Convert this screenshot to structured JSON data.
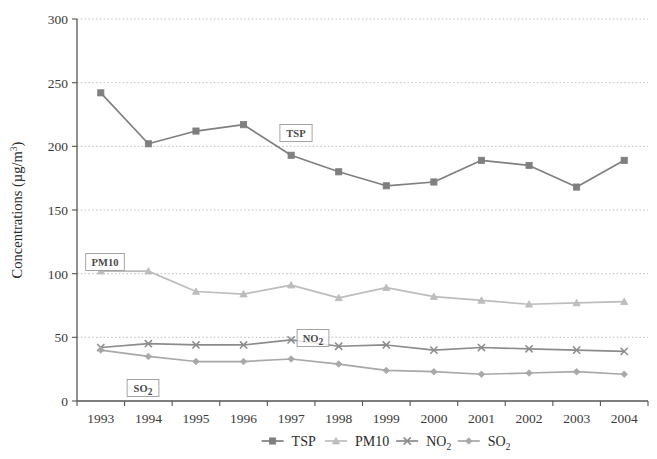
{
  "chart_data": {
    "type": "line",
    "title": "",
    "xlabel": "",
    "ylabel": "Concentrations (µg/m³)",
    "ylabel_base": "Concentrations (µg/m",
    "ylabel_sup": "3",
    "ylabel_tail": ")",
    "categories": [
      "1993",
      "1994",
      "1995",
      "1996",
      "1997",
      "1998",
      "1999",
      "2000",
      "2001",
      "2002",
      "2003",
      "2004"
    ],
    "x": [
      1993,
      1994,
      1995,
      1996,
      1997,
      1998,
      1999,
      2000,
      2001,
      2002,
      2003,
      2004
    ],
    "ylim": [
      0,
      300
    ],
    "yticks": [
      0,
      50,
      100,
      150,
      200,
      250,
      300
    ],
    "ytick_labels": [
      "0",
      "50",
      "100",
      "150",
      "200",
      "250",
      "300"
    ],
    "grid": true,
    "grid_style": "dotted-horizontal",
    "legend_position": "bottom",
    "series": [
      {
        "name": "TSP",
        "marker": "square",
        "color": "#7f7f7f",
        "values": [
          242,
          202,
          212,
          217,
          193,
          180,
          169,
          172,
          189,
          185,
          168,
          189
        ]
      },
      {
        "name": "PM10",
        "marker": "triangle",
        "color": "#bdbdbd",
        "values": [
          102,
          102,
          86,
          84,
          91,
          81,
          89,
          82,
          79,
          76,
          77,
          78
        ]
      },
      {
        "name": "NO2",
        "marker": "cross",
        "color": "#8c8c8c",
        "values": [
          42,
          45,
          44,
          44,
          48,
          43,
          44,
          40,
          42,
          41,
          40,
          39
        ]
      },
      {
        "name": "SO2",
        "marker": "diamond",
        "color": "#a8a8a8",
        "values": [
          40,
          35,
          31,
          31,
          33,
          29,
          24,
          23,
          21,
          22,
          23,
          21
        ]
      }
    ],
    "annotations": [
      {
        "text": "TSP",
        "series": "TSP",
        "x_pixel": 296,
        "y_pixel": 133
      },
      {
        "text": "PM10",
        "series": "PM10",
        "x_pixel": 105,
        "y_pixel": 262
      },
      {
        "text": "NO2",
        "series": "NO2",
        "x_pixel": 313,
        "y_pixel": 338,
        "sub": "2",
        "base": "NO"
      },
      {
        "text": "SO2",
        "series": "SO2",
        "x_pixel": 143,
        "y_pixel": 388,
        "sub": "2",
        "base": "SO"
      }
    ]
  },
  "legend": {
    "entries": [
      {
        "label": "TSP",
        "marker": "square",
        "color": "#7f7f7f"
      },
      {
        "label": "PM10",
        "marker": "triangle",
        "color": "#bdbdbd"
      },
      {
        "label": "NO2",
        "base": "NO",
        "sub": "2",
        "marker": "cross",
        "color": "#8c8c8c"
      },
      {
        "label": "SO2",
        "base": "SO",
        "sub": "2",
        "marker": "diamond",
        "color": "#a8a8a8"
      }
    ]
  },
  "axes": {
    "y_title_base": "Concentrations (µg/m",
    "y_title_sup": "3",
    "y_title_tail": ")"
  },
  "colors": {
    "tsp": "#7f7f7f",
    "pm10": "#bdbdbd",
    "no2": "#8c8c8c",
    "so2": "#a8a8a8",
    "axis": "#555555",
    "grid": "#b9b9b9",
    "text": "#2b2b2b"
  }
}
